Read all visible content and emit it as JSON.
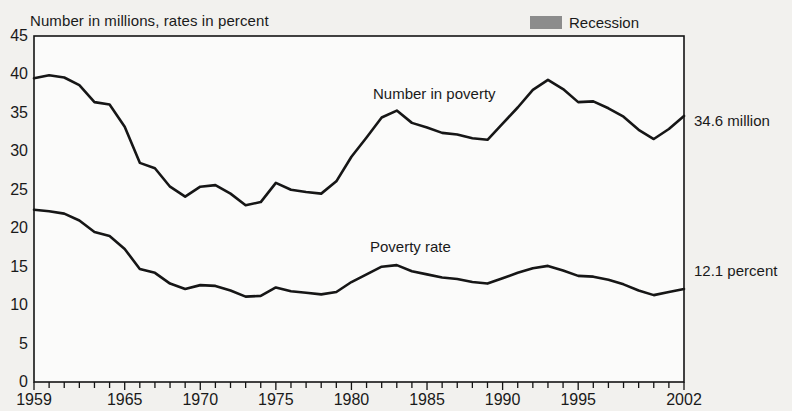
{
  "header": {
    "axis_note": "Number in millions, rates in percent",
    "legend": {
      "swatch_color": "#8c8c8c",
      "label": "Recession"
    }
  },
  "annotations": {
    "number_series_label": "Number in poverty",
    "rate_series_label": "Poverty rate",
    "number_end_label": "34.6 million",
    "rate_end_label": "12.1 percent"
  },
  "chart_data": {
    "type": "line",
    "title": "",
    "subtitle": "",
    "xlabel": "",
    "ylabel": "Number in millions, rates in percent",
    "xlim": [
      1959,
      2002
    ],
    "ylim": [
      0,
      45
    ],
    "ytick_step": 5,
    "yticks": [
      0,
      5,
      10,
      15,
      20,
      25,
      30,
      35,
      40,
      45
    ],
    "xticks": [
      1959,
      1965,
      1970,
      1975,
      1980,
      1985,
      1990,
      1995,
      2002
    ],
    "xtick_labels": [
      "1959",
      "1965",
      "1970",
      "1975",
      "1980",
      "1985",
      "1990",
      "1995",
      "2002"
    ],
    "minor_xticks_every": 1,
    "grid": "horizontal",
    "legend_position": "top-right",
    "x": [
      1959,
      1960,
      1961,
      1962,
      1963,
      1964,
      1965,
      1966,
      1967,
      1968,
      1969,
      1970,
      1971,
      1972,
      1973,
      1974,
      1975,
      1976,
      1977,
      1978,
      1979,
      1980,
      1981,
      1982,
      1983,
      1984,
      1985,
      1986,
      1987,
      1988,
      1989,
      1990,
      1991,
      1992,
      1993,
      1994,
      1995,
      1996,
      1997,
      1998,
      1999,
      2000,
      2001,
      2002
    ],
    "series": [
      {
        "name": "Number in poverty",
        "units": "millions",
        "end_value": 34.6,
        "values": [
          39.5,
          39.9,
          39.6,
          38.6,
          36.4,
          36.1,
          33.2,
          28.5,
          27.8,
          25.4,
          24.1,
          25.4,
          25.6,
          24.5,
          23.0,
          23.4,
          25.9,
          25.0,
          24.7,
          24.5,
          26.1,
          29.3,
          31.8,
          34.4,
          35.3,
          33.7,
          33.1,
          32.4,
          32.2,
          31.7,
          31.5,
          33.6,
          35.7,
          38.0,
          39.3,
          38.1,
          36.4,
          36.5,
          35.6,
          34.5,
          32.8,
          31.6,
          32.9,
          34.6
        ]
      },
      {
        "name": "Poverty rate",
        "units": "percent",
        "end_value": 12.1,
        "values": [
          22.4,
          22.2,
          21.9,
          21.0,
          19.5,
          19.0,
          17.3,
          14.7,
          14.2,
          12.8,
          12.1,
          12.6,
          12.5,
          11.9,
          11.1,
          11.2,
          12.3,
          11.8,
          11.6,
          11.4,
          11.7,
          13.0,
          14.0,
          15.0,
          15.2,
          14.4,
          14.0,
          13.6,
          13.4,
          13.0,
          12.8,
          13.5,
          14.2,
          14.8,
          15.1,
          14.5,
          13.8,
          13.7,
          13.3,
          12.7,
          11.9,
          11.3,
          11.7,
          12.1
        ]
      }
    ],
    "recessions": [
      {
        "label": "1960-61",
        "start": 1960.3,
        "end": 1961.1
      },
      {
        "label": "1969-70",
        "start": 1969.9,
        "end": 1970.8
      },
      {
        "label": "1973-75",
        "start": 1973.9,
        "end": 1975.2
      },
      {
        "label": "1980",
        "start": 1980.1,
        "end": 1980.6
      },
      {
        "label": "1981-82",
        "start": 1981.5,
        "end": 1982.9
      },
      {
        "label": "1990-91",
        "start": 1990.5,
        "end": 1991.2
      },
      {
        "label": "2001",
        "start": 2001.2,
        "end": 2001.9
      }
    ]
  }
}
